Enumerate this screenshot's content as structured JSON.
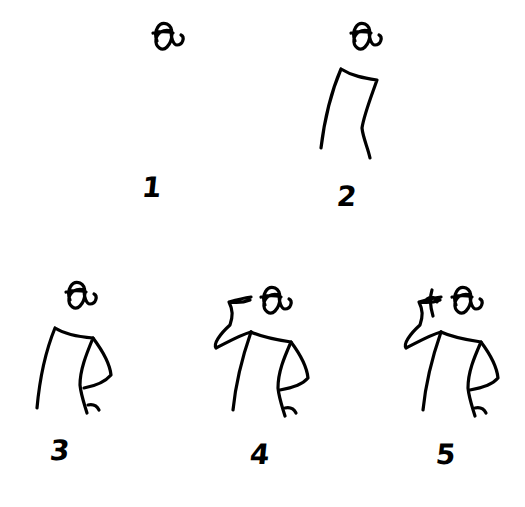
{
  "diagram": {
    "type": "step-by-step drawing tutorial",
    "stroke_color": "#000000",
    "background": "#ffffff",
    "steps": [
      {
        "label": "1",
        "description": "Draw the head with hair bun"
      },
      {
        "label": "2",
        "description": "Add the torso outline below the head"
      },
      {
        "label": "3",
        "description": "Add the right arm bent with hand on hip"
      },
      {
        "label": "4",
        "description": "Add the left arm raised to the head"
      },
      {
        "label": "5",
        "description": "Add fingers near the head"
      }
    ]
  }
}
